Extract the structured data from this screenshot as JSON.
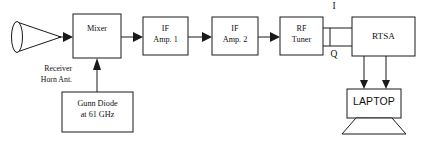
{
  "diagram": {
    "stroke_color": "#1a1a1a",
    "background_color": "#ffffff",
    "blocks": [
      {
        "id": "antenna",
        "label_line1": "Receiver",
        "label_line2": "Horn Ant.",
        "shape": "horn-antenna"
      },
      {
        "id": "mixer",
        "label": "Mixer",
        "shape": "rect"
      },
      {
        "id": "if_amp_1",
        "label_line1": "IF",
        "label_line2": "Amp. 1",
        "shape": "rect"
      },
      {
        "id": "if_amp_2",
        "label_line1": "IF",
        "label_line2": "Amp. 2",
        "shape": "rect"
      },
      {
        "id": "rf_tuner",
        "label_line1": "RF",
        "label_line2": "Tuner",
        "shape": "rect"
      },
      {
        "id": "rtsa",
        "label": "RTSA",
        "shape": "rect"
      },
      {
        "id": "gunn_diode",
        "label_line1": "Gunn Diode",
        "label_line2": "at 61 GHz",
        "shape": "rect"
      },
      {
        "id": "laptop",
        "label": "LAPTOP",
        "shape": "laptop"
      }
    ],
    "signal_labels": {
      "i": "I",
      "q": "Q"
    }
  }
}
